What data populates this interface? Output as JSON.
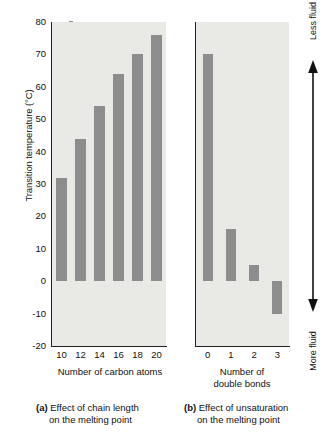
{
  "chart_data": [
    {
      "type": "bar",
      "panel": "a",
      "categories": [
        "10",
        "12",
        "14",
        "16",
        "18",
        "20"
      ],
      "values": [
        32,
        44,
        54,
        64,
        70,
        76
      ],
      "title": "",
      "xlabel": "Number of carbon atoms",
      "ylabel": "Transition temperature (°C)",
      "ylim": [
        -20,
        80
      ],
      "yticks": [
        "80",
        "70",
        "60",
        "50",
        "40",
        "30",
        "20",
        "10",
        "0",
        "-10",
        "-20"
      ],
      "grid": false,
      "legend": "none",
      "caption_marker": "(a)",
      "caption_line1": "Effect of chain length",
      "caption_line2": "on the melting point"
    },
    {
      "type": "bar",
      "panel": "b",
      "categories": [
        "0",
        "1",
        "2",
        "3"
      ],
      "values": [
        70,
        16,
        5,
        -10
      ],
      "title": "",
      "xlabel_line1": "Number of",
      "xlabel_line2": "double bonds",
      "xlabel": "Number of double bonds",
      "ylabel": "Transition temperature (°C)",
      "ylim": [
        -20,
        80
      ],
      "grid": false,
      "legend": "none",
      "caption_marker": "(b)",
      "caption_line1": "Effect of unsaturation",
      "caption_line2": "on the melting point"
    }
  ],
  "axis": {
    "y_title": "Transition temperature (°C)",
    "y_ticks": [
      "80",
      "70",
      "60",
      "50",
      "40",
      "30",
      "20",
      "10",
      "0",
      "-10",
      "-20"
    ]
  },
  "panel_a": {
    "x_title": "Number of carbon atoms",
    "x_ticks": [
      "10",
      "12",
      "14",
      "16",
      "18",
      "20"
    ],
    "caption_marker": "(a)",
    "caption_line1": "Effect of chain length",
    "caption_line2": "on the melting point"
  },
  "panel_b": {
    "x_title_line1": "Number of",
    "x_title_line2": "double bonds",
    "x_ticks": [
      "0",
      "1",
      "2",
      "3"
    ],
    "caption_marker": "(b)",
    "caption_line1": "Effect of unsaturation",
    "caption_line2": "on the melting point"
  },
  "fluidity_scale": {
    "top_label": "Less fluid",
    "bottom_label": "More fluid",
    "arrow": "double-headed-vertical-arrow"
  },
  "colors": {
    "bar": "#8d8d8d",
    "panel_background": "#e9e9e6",
    "axis": "#222222",
    "text": "#111111",
    "page_background": "#ffffff"
  }
}
